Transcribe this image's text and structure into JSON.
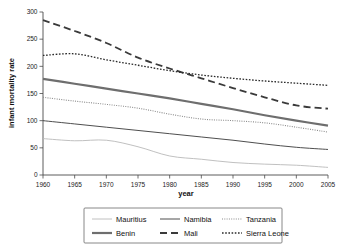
{
  "chart_data": {
    "type": "line",
    "title": "",
    "xlabel": "year",
    "ylabel": "infant mortality rate",
    "xlim": [
      1960,
      2005
    ],
    "ylim": [
      0,
      300
    ],
    "grid": false,
    "legend_position": "bottom",
    "xticks": [
      1960,
      1965,
      1970,
      1975,
      1980,
      1985,
      1990,
      1995,
      2000,
      2005
    ],
    "yticks": [
      0,
      50,
      100,
      150,
      200,
      250,
      300
    ],
    "x": [
      1960,
      1965,
      1970,
      1975,
      1980,
      1985,
      1990,
      1995,
      2000,
      2005
    ],
    "series": [
      {
        "name": "Mauritius",
        "color": "#b9b9b9",
        "width": 0.9,
        "dash": "none",
        "values": [
          67,
          63,
          64,
          52,
          35,
          29,
          23,
          20,
          18,
          14
        ]
      },
      {
        "name": "Namibia",
        "color": "#3a3a3a",
        "width": 0.9,
        "dash": "none",
        "values": [
          100,
          94,
          88,
          82,
          76,
          70,
          64,
          57,
          51,
          47
        ]
      },
      {
        "name": "Tanzania",
        "color": "#8a8a8a",
        "width": 1.1,
        "dash": "fine-dot",
        "values": [
          143,
          136,
          130,
          123,
          112,
          103,
          100,
          96,
          88,
          79
        ]
      },
      {
        "name": "Benin",
        "color": "#6e6e6e",
        "width": 2.2,
        "dash": "none",
        "values": [
          177,
          168,
          159,
          150,
          141,
          131,
          121,
          110,
          100,
          91
        ]
      },
      {
        "name": "Mali",
        "color": "#3a3a3a",
        "width": 1.8,
        "dash": "long-dash",
        "values": [
          285,
          265,
          243,
          216,
          196,
          178,
          160,
          143,
          128,
          122
        ]
      },
      {
        "name": "Sierra Leone",
        "color": "#2a2a2a",
        "width": 1.3,
        "dash": "dot",
        "values": [
          220,
          223,
          212,
          202,
          192,
          184,
          178,
          173,
          169,
          165
        ]
      }
    ]
  },
  "legend": {
    "entries": [
      {
        "label": "Mauritius"
      },
      {
        "label": "Namibia"
      },
      {
        "label": "Tanzania"
      },
      {
        "label": "Benin"
      },
      {
        "label": "Mali"
      },
      {
        "label": "Sierra Leone"
      }
    ]
  }
}
